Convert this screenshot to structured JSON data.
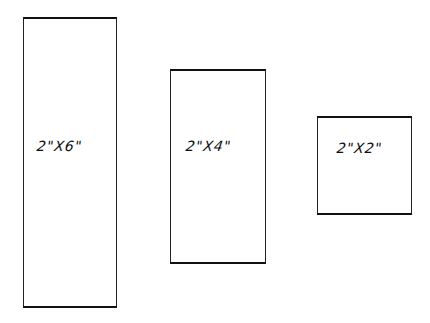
{
  "diagram": {
    "boards": [
      {
        "label": "2\"X6\""
      },
      {
        "label": "2\"X4\""
      },
      {
        "label": "2\"X2\""
      }
    ]
  }
}
